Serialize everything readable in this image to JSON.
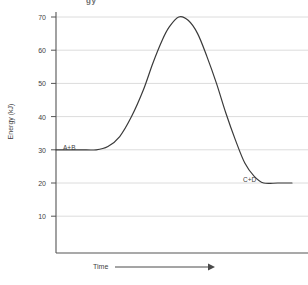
{
  "figure": {
    "clipped_top_text": "gy",
    "background_color": "#ffffff",
    "curve_color": "#3a3a3a",
    "grid_color": "#d9d9d9",
    "axis_color": "#555555",
    "text_color": "#3f3f3f"
  },
  "chart_data": {
    "type": "line",
    "title": "",
    "xlabel": "Time",
    "ylabel": "Energy (kJ)",
    "ylim": [
      0,
      70
    ],
    "yticks": [
      10,
      20,
      30,
      40,
      50,
      60,
      70
    ],
    "ytick_labels": [
      "10",
      "20",
      "30",
      "40",
      "50",
      "60",
      "70"
    ],
    "xticks": [],
    "xtick_labels": [],
    "grid": true,
    "legend": "none",
    "series": [
      {
        "name": "reaction-energy-profile",
        "points": [
          {
            "x": 0.0,
            "y": 30
          },
          {
            "x": 0.1,
            "y": 30
          },
          {
            "x": 0.17,
            "y": 30
          },
          {
            "x": 0.22,
            "y": 31
          },
          {
            "x": 0.27,
            "y": 34
          },
          {
            "x": 0.32,
            "y": 40
          },
          {
            "x": 0.37,
            "y": 48
          },
          {
            "x": 0.41,
            "y": 56
          },
          {
            "x": 0.45,
            "y": 63
          },
          {
            "x": 0.48,
            "y": 67
          },
          {
            "x": 0.52,
            "y": 70
          },
          {
            "x": 0.56,
            "y": 69
          },
          {
            "x": 0.6,
            "y": 65
          },
          {
            "x": 0.64,
            "y": 58
          },
          {
            "x": 0.68,
            "y": 50
          },
          {
            "x": 0.72,
            "y": 41
          },
          {
            "x": 0.76,
            "y": 33
          },
          {
            "x": 0.8,
            "y": 26
          },
          {
            "x": 0.84,
            "y": 22
          },
          {
            "x": 0.88,
            "y": 20
          },
          {
            "x": 0.94,
            "y": 20
          },
          {
            "x": 1.0,
            "y": 20
          }
        ]
      }
    ],
    "annotations": [
      {
        "label": "A+B",
        "x": 0.04,
        "y": 30,
        "note": "reactants plateau"
      },
      {
        "label": "C+D",
        "x": 0.82,
        "y": 20,
        "note": "products plateau"
      }
    ],
    "axis_arrow": {
      "axis": "x",
      "label": "Time",
      "direction": "right"
    }
  }
}
